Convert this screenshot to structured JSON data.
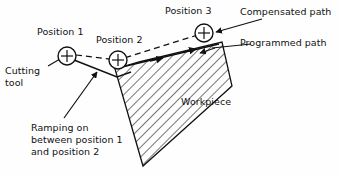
{
  "diagram": {
    "background_color": "#fefefe",
    "line_color": "#111111",
    "labels": {
      "position1": "Position 1",
      "position2": "Position 2",
      "position3": "Position 3",
      "compensated_path": "Compensated path",
      "programmed_path": "Programmed path",
      "cutting_tool_line1": "Cutting",
      "cutting_tool_line2": "tool",
      "workpiece": "Workpiece",
      "ramping_line1": "Ramping on",
      "ramping_line2": "between position 1",
      "ramping_line3": "and position 2"
    },
    "markers": {
      "position1": {
        "cx": 67,
        "cy": 56,
        "r": 9,
        "glyph": "+"
      },
      "position2": {
        "cx": 118,
        "cy": 60,
        "r": 9,
        "glyph": "+"
      },
      "position3": {
        "cx": 204,
        "cy": 33,
        "r": 9,
        "glyph": "+"
      }
    },
    "workpiece_outline": "115,68 222,42 143,165",
    "hatch_angle_deg": 45,
    "paths": {
      "compensated_path_style": "dashed",
      "programmed_path_style": "solid",
      "tool_path_style": "solid"
    }
  }
}
